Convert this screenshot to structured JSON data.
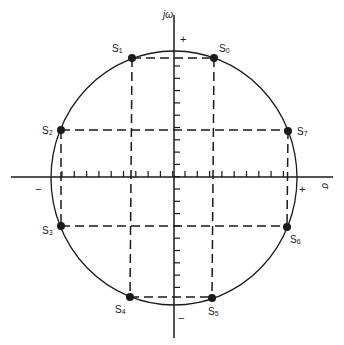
{
  "diagram": {
    "type": "s-plane constellation",
    "axes": {
      "vertical_label": "jω",
      "horizontal_label": "σ",
      "vertical_plus": "+",
      "vertical_minus": "−",
      "horizontal_plus": "+",
      "horizontal_minus": "−"
    },
    "points": [
      {
        "name": "S",
        "index": "0",
        "x": 214,
        "y": 58,
        "label_x": 219,
        "label_y": 52
      },
      {
        "name": "S",
        "index": "1",
        "x": 132,
        "y": 58,
        "label_x": 112,
        "label_y": 52
      },
      {
        "name": "S",
        "index": "2",
        "x": 61,
        "y": 130,
        "label_x": 42,
        "label_y": 134
      },
      {
        "name": "S",
        "index": "3",
        "x": 61,
        "y": 226,
        "label_x": 42,
        "label_y": 234
      },
      {
        "name": "S",
        "index": "4",
        "x": 130,
        "y": 297,
        "label_x": 115,
        "label_y": 313
      },
      {
        "name": "S",
        "index": "5",
        "x": 212,
        "y": 298,
        "label_x": 208,
        "label_y": 315
      },
      {
        "name": "S",
        "index": "6",
        "x": 287,
        "y": 227,
        "label_x": 290,
        "label_y": 243
      },
      {
        "name": "S",
        "index": "7",
        "x": 288,
        "y": 131,
        "label_x": 297,
        "label_y": 135
      }
    ],
    "colors": {
      "line": "#1a1a1a",
      "background": "#ffffff"
    }
  }
}
